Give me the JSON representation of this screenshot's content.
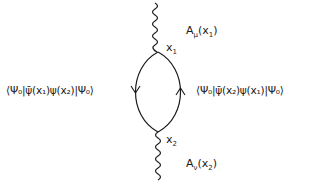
{
  "diagram": {
    "type": "feynman-diagram",
    "vertices": [
      {
        "id": "x1",
        "label": "x",
        "sub": "1"
      },
      {
        "id": "x2",
        "label": "x",
        "sub": "2"
      }
    ],
    "photon_lines": [
      {
        "id": "top",
        "label": "A",
        "index": "μ",
        "arg": "(x",
        "arg_sub": "1",
        "close": ")"
      },
      {
        "id": "bottom",
        "label": "A",
        "index": "ν",
        "arg": "(x",
        "arg_sub": "2",
        "close": ")"
      }
    ],
    "fermion_arcs": [
      {
        "id": "left",
        "arrow": "down"
      },
      {
        "id": "right",
        "arrow": "up"
      }
    ],
    "left_expression": "⟨Ψ₀|ψ̄(x₁)ψ(x₂)|Ψ₀⟩",
    "right_expression": "⟨Ψ₀|ψ̄(x₂)ψ(x₁)|Ψ₀⟩"
  }
}
